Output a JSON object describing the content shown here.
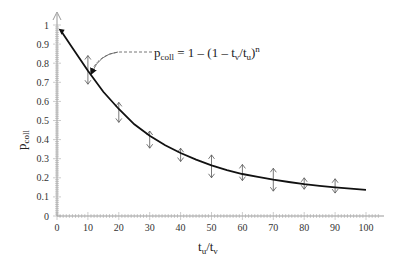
{
  "chart_data": {
    "type": "line",
    "title": "",
    "xlabel": "t_u/t_v",
    "ylabel": "p_coll",
    "xlim": [
      0,
      105
    ],
    "ylim": [
      0,
      1.0
    ],
    "x_ticks": [
      0,
      10,
      20,
      30,
      40,
      50,
      60,
      70,
      80,
      90,
      100
    ],
    "y_ticks": [
      0,
      0.1,
      0.2,
      0.3,
      0.4,
      0.5,
      0.6,
      0.7,
      0.8,
      0.9,
      1
    ],
    "y_tick_labels": [
      "0",
      "0.1",
      "0.2",
      "0.3",
      "0.4",
      "0.5",
      "0.6",
      "0.7",
      "0.8",
      "0.9",
      "1"
    ],
    "x_tick_labels": [
      "0",
      "10",
      "20",
      "30",
      "40",
      "50",
      "60",
      "70",
      "80",
      "90",
      "100"
    ],
    "grid": false,
    "annotation": {
      "lhs": "p",
      "lhs_sub": "coll",
      "rhs": "= 1 – (1 – t",
      "rhs_sub1": "v",
      "mid": "/t",
      "rhs_sub2": "u",
      "close": ")",
      "sup": "n",
      "text": "p_coll = 1 – (1 – t_v/t_u)^n"
    },
    "series": [
      {
        "name": "model curve",
        "style": "solid line",
        "x": [
          1.5,
          5,
          10,
          15,
          20,
          25,
          30,
          35,
          40,
          45,
          50,
          55,
          60,
          65,
          70,
          75,
          80,
          85,
          90,
          95,
          100
        ],
        "values": [
          0.965,
          0.88,
          0.76,
          0.65,
          0.56,
          0.48,
          0.42,
          0.37,
          0.33,
          0.295,
          0.265,
          0.24,
          0.22,
          0.205,
          0.19,
          0.178,
          0.167,
          0.158,
          0.15,
          0.143,
          0.137
        ]
      },
      {
        "name": "measured (mean with error bars)",
        "style": "double-arrow error bars",
        "x": [
          10,
          20,
          30,
          40,
          50,
          60,
          70,
          80,
          90
        ],
        "values": [
          0.79,
          0.545,
          0.4,
          0.32,
          0.26,
          0.225,
          0.19,
          0.17,
          0.155
        ],
        "err_low": [
          0.69,
          0.49,
          0.355,
          0.285,
          0.2,
          0.185,
          0.13,
          0.14,
          0.12
        ],
        "err_high": [
          0.84,
          0.595,
          0.445,
          0.355,
          0.32,
          0.27,
          0.25,
          0.2,
          0.195
        ]
      }
    ]
  }
}
